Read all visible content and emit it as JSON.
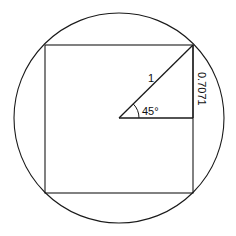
{
  "diagram": {
    "labels": {
      "hypotenuse": "1",
      "angle": "45°",
      "side": "0.7071"
    },
    "colors": {
      "stroke": "#1a1a1a",
      "background": "#ffffff"
    }
  }
}
